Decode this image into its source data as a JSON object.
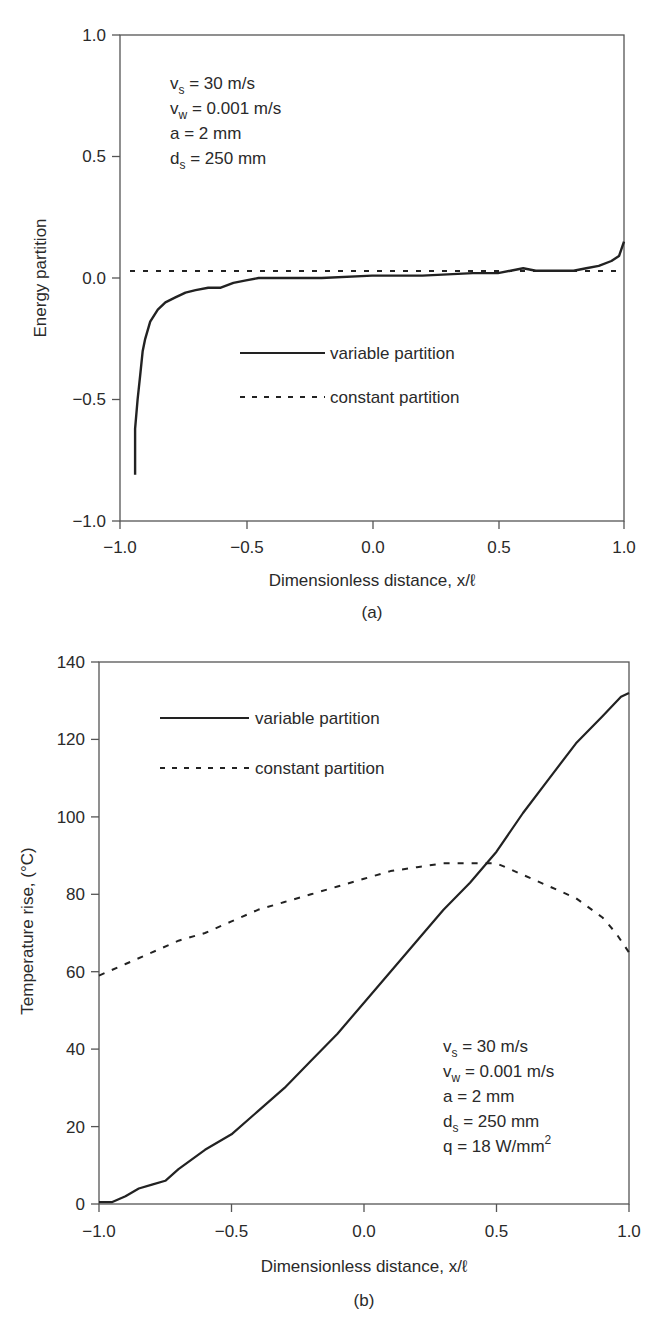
{
  "chart_data": [
    {
      "type": "line",
      "panel_label": "(a)",
      "title": "",
      "xlabel": "Dimensionless distance, x/ℓ",
      "ylabel": "Energy partition",
      "xlim": [
        -1.0,
        1.0
      ],
      "ylim": [
        -1.0,
        1.0
      ],
      "xticks": [
        "−1.0",
        "−0.5",
        "0.0",
        "0.5",
        "1.0"
      ],
      "yticks": [
        "−1.0",
        "−0.5",
        "0.0",
        "0.5",
        "1.0"
      ],
      "grid": false,
      "legend_position": "center",
      "annotations": [
        "vs = 30 m/s",
        "vw = 0.001 m/s",
        "a = 2 mm",
        "ds = 250 mm"
      ],
      "series": [
        {
          "name": "variable partition",
          "style": "solid",
          "x": [
            -0.94,
            -0.94,
            -0.93,
            -0.92,
            -0.91,
            -0.9,
            -0.88,
            -0.85,
            -0.82,
            -0.78,
            -0.74,
            -0.7,
            -0.65,
            -0.6,
            -0.55,
            -0.5,
            -0.45,
            -0.35,
            -0.2,
            0.0,
            0.2,
            0.4,
            0.5,
            0.55,
            0.6,
            0.65,
            0.7,
            0.8,
            0.85,
            0.9,
            0.95,
            0.98,
            0.99,
            1.0
          ],
          "values": [
            -0.81,
            -0.62,
            -0.5,
            -0.4,
            -0.3,
            -0.25,
            -0.18,
            -0.13,
            -0.1,
            -0.08,
            -0.06,
            -0.05,
            -0.04,
            -0.04,
            -0.02,
            -0.01,
            0.0,
            0.0,
            0.0,
            0.01,
            0.01,
            0.02,
            0.02,
            0.03,
            0.04,
            0.03,
            0.03,
            0.03,
            0.04,
            0.05,
            0.07,
            0.09,
            0.12,
            0.15
          ]
        },
        {
          "name": "constant partition",
          "style": "dashed",
          "x": [
            -1.0,
            1.0
          ],
          "values": [
            0.03,
            0.03
          ]
        }
      ]
    },
    {
      "type": "line",
      "panel_label": "(b)",
      "title": "",
      "xlabel": "Dimensionless distance, x/ℓ",
      "ylabel": "Temperature rise, (°C)",
      "xlim": [
        -1.0,
        1.0
      ],
      "ylim": [
        0,
        140
      ],
      "xticks": [
        "−1.0",
        "−0.5",
        "0.0",
        "0.5",
        "1.0"
      ],
      "yticks": [
        "0",
        "20",
        "40",
        "60",
        "80",
        "100",
        "120",
        "140"
      ],
      "grid": false,
      "legend_position": "upper left",
      "annotations": [
        "vs = 30 m/s",
        "vw = 0.001 m/s",
        "a = 2 mm",
        "ds = 250 mm",
        "q = 18 W/mm2"
      ],
      "series": [
        {
          "name": "variable partition",
          "style": "solid",
          "x": [
            -1.0,
            -0.95,
            -0.9,
            -0.85,
            -0.8,
            -0.75,
            -0.7,
            -0.6,
            -0.5,
            -0.4,
            -0.3,
            -0.2,
            -0.1,
            0.0,
            0.1,
            0.2,
            0.3,
            0.4,
            0.5,
            0.6,
            0.7,
            0.8,
            0.9,
            0.97,
            1.0
          ],
          "values": [
            0.5,
            0.5,
            2,
            4,
            5,
            6,
            9,
            14,
            18,
            24,
            30,
            37,
            44,
            52,
            60,
            68,
            76,
            83,
            91,
            101,
            110,
            119,
            126,
            131,
            132
          ]
        },
        {
          "name": "constant partition",
          "style": "dashed",
          "x": [
            -1.0,
            -0.9,
            -0.8,
            -0.7,
            -0.6,
            -0.5,
            -0.4,
            -0.3,
            -0.2,
            -0.1,
            0.0,
            0.1,
            0.2,
            0.3,
            0.4,
            0.5,
            0.6,
            0.7,
            0.8,
            0.9,
            0.95,
            1.0
          ],
          "values": [
            59,
            62,
            65,
            68,
            70,
            73,
            76,
            78,
            80,
            82,
            84,
            86,
            87,
            88,
            88,
            88,
            85,
            82,
            79,
            74,
            70,
            65
          ]
        }
      ]
    }
  ],
  "panel_a": {
    "ylabel": "Energy partition",
    "xlabel": "Dimensionless distance, x/ℓ",
    "caption": "(a)",
    "yticks": [
      "1.0",
      "0.5",
      "0.0",
      "−0.5",
      "−1.0"
    ],
    "xticks": [
      "−1.0",
      "−0.5",
      "0.0",
      "0.5",
      "1.0"
    ],
    "legend": {
      "variable": "variable partition",
      "constant": "constant partition"
    },
    "annotation": {
      "vs_main": "v",
      "vs_sub": "s",
      "vs_rest": " = 30 m/s",
      "vw_main": "v",
      "vw_sub": "w",
      "vw_rest": " = 0.001 m/s",
      "a": "a = 2 mm",
      "ds_main": "d",
      "ds_sub": "s",
      "ds_rest": " = 250 mm"
    }
  },
  "panel_b": {
    "ylabel": "Temperature rise, (°C)",
    "xlabel": "Dimensionless distance, x/ℓ",
    "caption": "(b)",
    "yticks": [
      "140",
      "120",
      "100",
      "80",
      "60",
      "40",
      "20",
      "0"
    ],
    "xticks": [
      "−1.0",
      "−0.5",
      "0.0",
      "0.5",
      "1.0"
    ],
    "legend": {
      "variable": "variable partition",
      "constant": "constant partition"
    },
    "annotation": {
      "vs_main": "v",
      "vs_sub": "s",
      "vs_rest": " = 30 m/s",
      "vw_main": "v",
      "vw_sub": "w",
      "vw_rest": " = 0.001 m/s",
      "a": "a = 2 mm",
      "ds_main": "d",
      "ds_sub": "s",
      "ds_rest": " = 250 mm",
      "q_main": "q = 18 W/mm",
      "q_sup": "2"
    }
  }
}
